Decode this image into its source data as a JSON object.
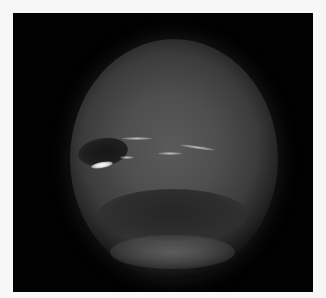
{
  "image": {
    "subject": "Neptune",
    "description": "Grayscale photograph of the planet Neptune on a black background showing a dark oval spot with a bright white companion cloud and faint high-altitude streaks, plus a dark southern band",
    "background_color": "#020202",
    "border_color": "#f7f7f7",
    "features": [
      "dark-spot",
      "bright-companion-cloud",
      "cloud-streaks",
      "dark-southern-band"
    ]
  }
}
